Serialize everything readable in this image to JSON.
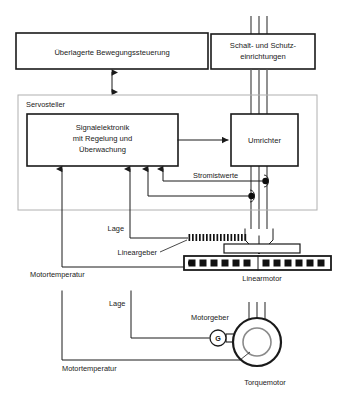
{
  "diagram": {
    "blocks": {
      "motion_control": "Überlagerte Bewegungssteuerung",
      "switchgear_line1": "Schalt- und Schutz-",
      "switchgear_line2": "einrichtungen",
      "servo_frame": "Servosteller",
      "signal_electronics_line1": "Signalelektronik",
      "signal_electronics_line2": "mit Regelung und",
      "signal_electronics_line3": "Überwachung",
      "converter": "Umrichter"
    },
    "signals": {
      "current_values": "Stromistwerte",
      "position_linear": "Lage",
      "motor_temp_linear": "Motortemperatur",
      "position_rotary": "Lage",
      "motor_temp_rotary": "Motortemperatur"
    },
    "components": {
      "linear_encoder": "Lineargeber",
      "linear_motor": "Linearmotor",
      "motor_encoder": "Motorgeber",
      "generator_symbol": "G",
      "torque_motor": "Torquemotor"
    },
    "colors": {
      "line": "#1a1a1a",
      "frame": "#b0b0b0",
      "power": "#555555",
      "background": "#ffffff",
      "magnet": "#111111"
    }
  }
}
